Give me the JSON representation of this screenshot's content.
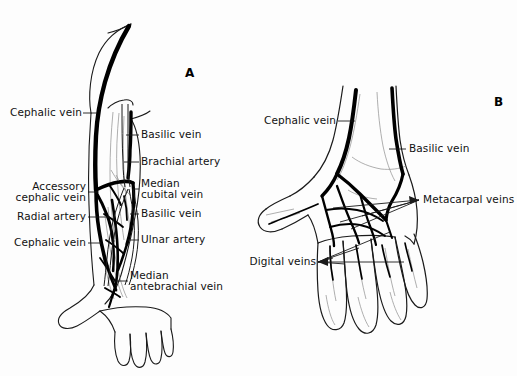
{
  "figure": {
    "background_color": "#fdfdfd",
    "ink_color": "#000000",
    "width": 517,
    "height": 376
  },
  "panels": [
    {
      "id": "A",
      "name": "panel-a-forearm",
      "label": "A"
    },
    {
      "id": "B",
      "name": "panel-b-hand",
      "label": "B"
    }
  ],
  "panel_a": {
    "labels_left": [
      {
        "key": "cephalic_vein_upper",
        "text": "Cephalic vein"
      },
      {
        "key": "accessory_cephalic_vein",
        "text": "Accessory\ncephalic vein"
      },
      {
        "key": "radial_artery",
        "text": "Radial artery"
      },
      {
        "key": "cephalic_vein_lower",
        "text": "Cephalic vein"
      }
    ],
    "labels_right": [
      {
        "key": "basilic_vein_upper",
        "text": "Basilic vein"
      },
      {
        "key": "brachial_artery",
        "text": "Brachial artery"
      },
      {
        "key": "median_cubital_vein",
        "text": "Median\ncubital vein"
      },
      {
        "key": "basilic_vein_lower",
        "text": "Basilic vein"
      },
      {
        "key": "ulnar_artery",
        "text": "Ulnar artery"
      },
      {
        "key": "median_antebrachial_vein",
        "text": "Median\nantebrachial vein"
      }
    ],
    "label_cephalic_upper": "Cephalic vein",
    "label_accessory_cephalic_l1": "Accessory",
    "label_accessory_cephalic_l2": "cephalic vein",
    "label_radial_artery": "Radial artery",
    "label_cephalic_lower": "Cephalic vein",
    "label_basilic_upper": "Basilic vein",
    "label_brachial_artery": "Brachial artery",
    "label_median_cubital_l1": "Median",
    "label_median_cubital_l2": "cubital vein",
    "label_basilic_lower": "Basilic vein",
    "label_ulnar_artery": "Ulnar artery",
    "label_median_antebrachial_l1": "Median",
    "label_median_antebrachial_l2": "antebrachial vein"
  },
  "panel_b": {
    "label_cephalic_vein": "Cephalic vein",
    "label_basilic_vein": "Basilic vein",
    "label_metacarpal_veins": "Metacarpal veins",
    "label_digital_veins": "Digital veins",
    "labels": [
      {
        "key": "cephalic_vein",
        "text": "Cephalic vein"
      },
      {
        "key": "basilic_vein",
        "text": "Basilic vein"
      },
      {
        "key": "metacarpal_veins",
        "text": "Metacarpal veins"
      },
      {
        "key": "digital_veins",
        "text": "Digital veins"
      }
    ]
  }
}
